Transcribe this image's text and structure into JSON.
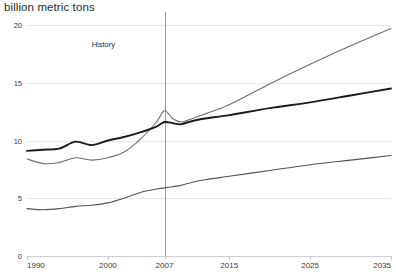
{
  "axis_title": "billion metric tons",
  "annotation": {
    "history_label": "History"
  },
  "colors": {
    "series_total": "#1a1a1a",
    "series_middle": "#6e6e6e",
    "series_bottom": "#555555",
    "gridline": "#e8e8e8",
    "divider": "#9a9a9a"
  },
  "chart_data": {
    "type": "line",
    "title": "",
    "subtitle": "",
    "xlabel": "",
    "ylabel": "billion metric tons",
    "ylim": [
      0,
      20
    ],
    "xlim": [
      1990,
      2035
    ],
    "yticks": [
      0,
      5,
      10,
      15,
      20
    ],
    "xticks": [
      1990,
      2000,
      2007,
      2015,
      2025,
      2035
    ],
    "grid": true,
    "legend_position": "none",
    "annotations": [
      {
        "text": "History",
        "x": 1998,
        "y": 18.3
      },
      {
        "type": "vline",
        "x": 2007,
        "label": "history-projection divider"
      }
    ],
    "series": [
      {
        "name": "Non-OECD",
        "color": "#6e6e6e",
        "x": [
          1990,
          1992,
          1994,
          1996,
          1998,
          2000,
          2002,
          2004,
          2006,
          2007,
          2008,
          2009,
          2010,
          2012,
          2015,
          2020,
          2025,
          2030,
          2035
        ],
        "values": [
          8.4,
          8.0,
          8.1,
          8.5,
          8.3,
          8.5,
          9.0,
          10.1,
          11.6,
          12.6,
          11.9,
          11.6,
          11.8,
          12.3,
          13.1,
          14.9,
          16.6,
          18.2,
          19.7
        ]
      },
      {
        "name": "OECD",
        "color": "#1a1a1a",
        "x": [
          1990,
          1992,
          1994,
          1996,
          1998,
          2000,
          2002,
          2004,
          2006,
          2007,
          2008,
          2009,
          2010,
          2012,
          2015,
          2020,
          2025,
          2030,
          2035
        ],
        "values": [
          9.1,
          9.2,
          9.3,
          9.9,
          9.6,
          10.0,
          10.3,
          10.7,
          11.2,
          11.6,
          11.5,
          11.4,
          11.6,
          11.9,
          12.2,
          12.8,
          13.3,
          13.9,
          14.5
        ]
      },
      {
        "name": "Coal",
        "color": "#555555",
        "x": [
          1990,
          1992,
          1994,
          1996,
          1998,
          2000,
          2002,
          2004,
          2006,
          2007,
          2008,
          2009,
          2010,
          2012,
          2015,
          2020,
          2025,
          2030,
          2035
        ],
        "values": [
          4.1,
          4.0,
          4.1,
          4.3,
          4.4,
          4.6,
          5.0,
          5.5,
          5.8,
          5.9,
          6.0,
          6.1,
          6.3,
          6.6,
          6.9,
          7.4,
          7.9,
          8.3,
          8.7
        ]
      }
    ]
  }
}
